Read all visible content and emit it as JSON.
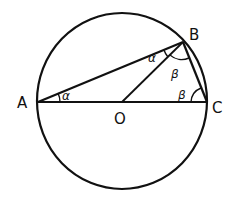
{
  "figure": {
    "colors": {
      "stroke": "#111111",
      "background": "#ffffff"
    },
    "points": {
      "A": {
        "label": "A",
        "x": 38,
        "y": 102
      },
      "B": {
        "label": "B",
        "x": 183,
        "y": 42
      },
      "C": {
        "label": "C",
        "x": 206,
        "y": 102
      },
      "O": {
        "label": "O",
        "x": 122,
        "y": 102
      }
    },
    "circle": {
      "cx": 122,
      "cy": 101,
      "rx": 85,
      "ry": 88
    },
    "segments": [
      "AB",
      "BC",
      "AC",
      "OB"
    ],
    "angle_labels": {
      "alpha_at_A": "α",
      "alpha_at_B": "α",
      "beta_at_B": "β",
      "beta_at_C": "β"
    }
  }
}
